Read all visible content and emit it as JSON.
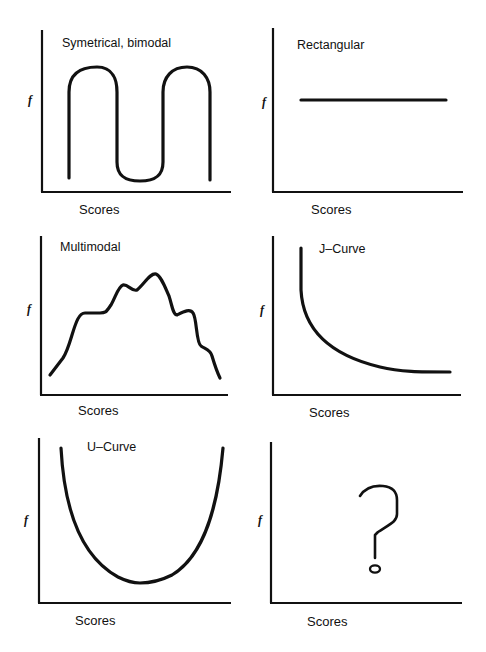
{
  "panels": [
    {
      "title": "Symetrical, bimodal",
      "xlabel": "Scores",
      "ylabel": "f",
      "shape": "bimodal"
    },
    {
      "title": "Rectangular",
      "xlabel": "Scores",
      "ylabel": "f",
      "shape": "rectangular"
    },
    {
      "title": "Multimodal",
      "xlabel": "Scores",
      "ylabel": "f",
      "shape": "multimodal"
    },
    {
      "title": "J–Curve",
      "xlabel": "Scores",
      "ylabel": "f",
      "shape": "j-curve"
    },
    {
      "title": "U–Curve",
      "xlabel": "Scores",
      "ylabel": "f",
      "shape": "u-curve"
    },
    {
      "title": "",
      "xlabel": "Scores",
      "ylabel": "f",
      "shape": "unknown",
      "symbol": "question-mark"
    }
  ],
  "colors": {
    "line": "#111111",
    "background": "#ffffff"
  }
}
